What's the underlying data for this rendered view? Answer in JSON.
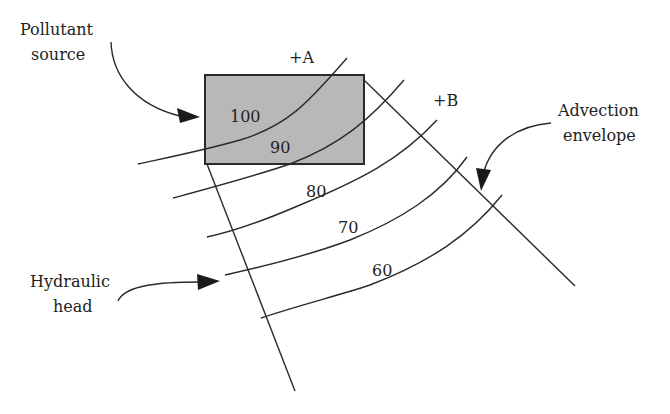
{
  "diagram": {
    "labels": {
      "pollutant_source": [
        "Pollutant",
        "source"
      ],
      "advection_envelope": [
        "Advection",
        "envelope"
      ],
      "hydraulic_head": [
        "Hydraulic",
        "head"
      ],
      "point_a": "+A",
      "point_b": "+B"
    },
    "contours": [
      {
        "value": "100"
      },
      {
        "value": "90"
      },
      {
        "value": "80"
      },
      {
        "value": "70"
      },
      {
        "value": "60"
      }
    ],
    "colors": {
      "source_fill": "#b8b8b8",
      "line": "#2a2a2a",
      "text": "#222222"
    }
  }
}
